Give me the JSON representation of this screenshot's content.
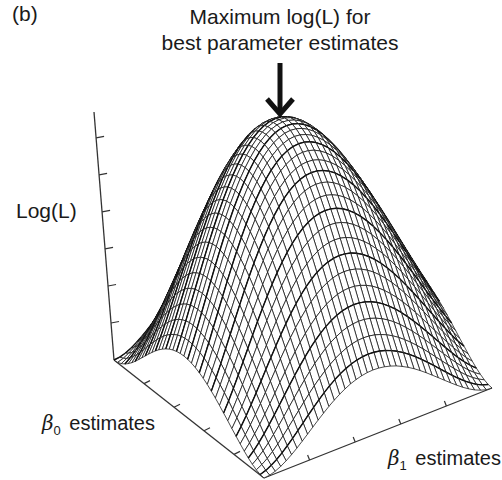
{
  "panel": {
    "label": "(b)"
  },
  "annotation": {
    "line1": "Maximum log(L) for",
    "line2": "best parameter estimates",
    "arrow": "down-arrow"
  },
  "axes": {
    "z_label": "Log(L)",
    "x_label": {
      "symbol": "β",
      "subscript": "0",
      "text": "estimates"
    },
    "y_label": {
      "symbol": "β",
      "subscript": "1",
      "text": "estimates"
    },
    "z_ticks": 6,
    "x_ticks": 4,
    "y_ticks": 4
  },
  "colors": {
    "line": "#111111",
    "fill": "#ffffff",
    "axis": "#333333"
  },
  "chart_data": {
    "type": "surface-wireframe",
    "title": "Maximum log(L) for best parameter estimates",
    "xlabel": "β0 estimates",
    "ylabel": "β1 estimates",
    "zlabel": "Log(L)",
    "surface": "z = (1 - (u^2 + v^2)/2)^2, u,v in [-1,1]",
    "grid_resolution": [
      41,
      41
    ],
    "peak": {
      "u": 0,
      "v": 0,
      "z": 1,
      "note": "maximum log-likelihood"
    },
    "tick_labels": "none shown",
    "projection": {
      "left_corner": [
        114,
        360
      ],
      "front_corner": [
        264,
        478
      ],
      "right_corner": [
        492,
        388
      ],
      "z_axis_top": [
        94,
        112
      ],
      "height_px": 252
    }
  }
}
